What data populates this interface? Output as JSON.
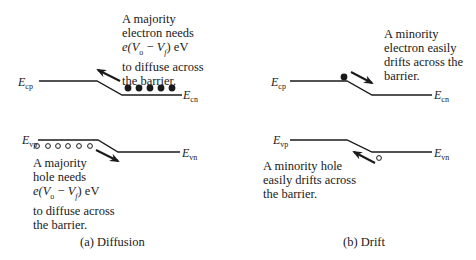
{
  "panels": [
    {
      "id": "a",
      "caption": "(a) Diffusion",
      "labels": {
        "ec_p": {
          "main": "E",
          "sub": "cp"
        },
        "ec_n": {
          "main": "E",
          "sub": "cn"
        },
        "ev_p": {
          "main": "E",
          "sub": "vp"
        },
        "ev_n": {
          "main": "E",
          "sub": "vn"
        }
      },
      "electron_note": [
        "A majority",
        "electron needs",
        "e(Vₒ − Vƒ) eV",
        "to diffuse across",
        "the barrier."
      ],
      "hole_note": [
        "A majority",
        "hole needs",
        "e(Vₒ − Vƒ) eV",
        "to diffuse across",
        "the barrier."
      ],
      "electron_count": 5,
      "hole_count": 6
    },
    {
      "id": "b",
      "caption": "(b) Drift",
      "labels": {
        "ec_p": {
          "main": "E",
          "sub": "cp"
        },
        "ec_n": {
          "main": "E",
          "sub": "cn"
        },
        "ev_p": {
          "main": "E",
          "sub": "vp"
        },
        "ev_n": {
          "main": "E",
          "sub": "vn"
        }
      },
      "electron_note": [
        "A minority",
        "electron easily",
        "drifts across the",
        "barrier."
      ],
      "hole_note": [
        "A minority hole",
        "easily drifts across",
        "the barrier."
      ],
      "electron_count": 1,
      "hole_count": 1
    }
  ],
  "formula": {
    "prefix": "e(",
    "v1": "V",
    "v1_sub": "o",
    "minus": " − ",
    "v2": "V",
    "v2_sub": "f",
    "suffix": ") eV"
  },
  "colors": {
    "ink": "#1a1a1a",
    "background": "#ffffff"
  }
}
